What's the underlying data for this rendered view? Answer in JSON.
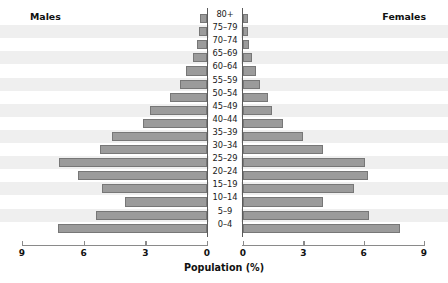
{
  "chart_data": {
    "type": "bar",
    "chart_subtype": "population-pyramid",
    "title": "",
    "xlabel": "Population (%)",
    "ylabel": "",
    "categories": [
      "80+",
      "75–79",
      "70–74",
      "65–69",
      "60–64",
      "55–59",
      "50–54",
      "45–49",
      "40–44",
      "35–39",
      "30–34",
      "25–29",
      "20–24",
      "15–19",
      "10–14",
      "5–9",
      "0–4"
    ],
    "series": [
      {
        "name": "Males",
        "side": "left",
        "values": [
          0.35,
          0.4,
          0.5,
          0.7,
          1.0,
          1.3,
          1.8,
          2.75,
          3.1,
          4.6,
          5.2,
          7.2,
          6.3,
          5.1,
          4.0,
          5.4,
          7.25
        ]
      },
      {
        "name": "Females",
        "side": "right",
        "values": [
          0.25,
          0.25,
          0.3,
          0.45,
          0.65,
          0.85,
          1.25,
          1.45,
          2.0,
          3.0,
          4.0,
          6.05,
          6.2,
          5.5,
          4.0,
          6.25,
          7.8
        ]
      }
    ],
    "xlim_left": [
      9,
      0
    ],
    "xlim_right": [
      0,
      9
    ],
    "xticks_left": [
      "9",
      "6",
      "3",
      "0"
    ],
    "xticks_right": [
      "0",
      "3",
      "6",
      "9"
    ],
    "xtick_values_left": [
      9,
      6,
      3,
      0
    ],
    "xtick_values_right": [
      0,
      3,
      6,
      9
    ],
    "grid": false,
    "legend_position": "inline-top-corners",
    "bar_color": "#9b9b9b",
    "bar_border_color": "#777777",
    "row_stripe_color": "#efefef",
    "axis_color": "#8a8a8a",
    "background_color": "#ffffff"
  },
  "header": {
    "males_label": "Males",
    "females_label": "Females"
  },
  "axis": {
    "title": "Population (%)"
  }
}
